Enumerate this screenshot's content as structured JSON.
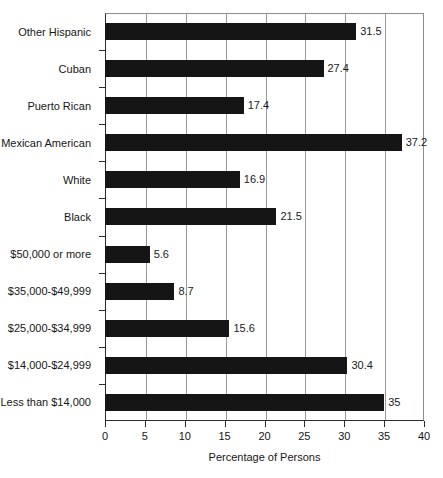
{
  "chart_data": {
    "type": "bar",
    "orientation": "horizontal",
    "title": "",
    "xlabel": "Percentage of Persons",
    "ylabel": "",
    "xlim": [
      0,
      40
    ],
    "xticks": [
      0,
      5,
      10,
      15,
      20,
      25,
      30,
      35,
      40
    ],
    "grid": "vertical",
    "legend": "none",
    "bar_color": "#151515",
    "categories": [
      "Other Hispanic",
      "Cuban",
      "Puerto Rican",
      "Mexican American",
      "White",
      "Black",
      "$50,000 or more",
      "$35,000-$49,999",
      "$25,000-$34,999",
      "$14,000-$24,999",
      "Less than $14,000"
    ],
    "values": [
      31.5,
      27.4,
      17.4,
      37.2,
      16.9,
      21.5,
      5.6,
      8.7,
      15.6,
      30.4,
      35
    ],
    "value_labels": [
      "31.5",
      "27.4",
      "17.4",
      "37.2",
      "16.9",
      "21.5",
      "5.6",
      "8.7",
      "15.6",
      "30.4",
      "35"
    ],
    "xtick_labels": [
      "0",
      "5",
      "10",
      "15",
      "20",
      "25",
      "30",
      "35",
      "40"
    ]
  }
}
